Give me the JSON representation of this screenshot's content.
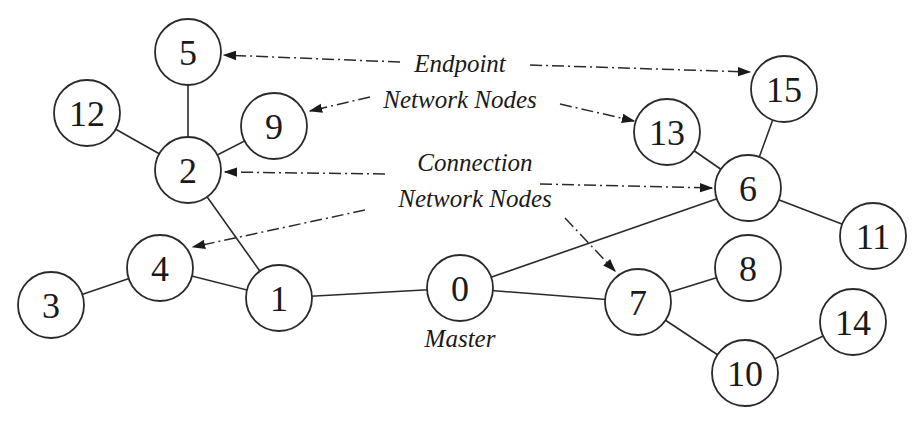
{
  "diagram": {
    "title": "",
    "nodes": [
      {
        "id": "0",
        "label": "0",
        "x": 460,
        "y": 288,
        "caption": "Master"
      },
      {
        "id": "1",
        "label": "1",
        "x": 279,
        "y": 298
      },
      {
        "id": "2",
        "label": "2",
        "x": 188,
        "y": 170
      },
      {
        "id": "3",
        "label": "3",
        "x": 51,
        "y": 305
      },
      {
        "id": "4",
        "label": "4",
        "x": 160,
        "y": 268
      },
      {
        "id": "5",
        "label": "5",
        "x": 188,
        "y": 52
      },
      {
        "id": "6",
        "label": "6",
        "x": 748,
        "y": 188
      },
      {
        "id": "7",
        "label": "7",
        "x": 638,
        "y": 302
      },
      {
        "id": "8",
        "label": "8",
        "x": 748,
        "y": 268
      },
      {
        "id": "9",
        "label": "9",
        "x": 274,
        "y": 126
      },
      {
        "id": "10",
        "label": "10",
        "x": 745,
        "y": 373
      },
      {
        "id": "11",
        "label": "11",
        "x": 873,
        "y": 236
      },
      {
        "id": "12",
        "label": "12",
        "x": 87,
        "y": 113
      },
      {
        "id": "13",
        "label": "13",
        "x": 667,
        "y": 132
      },
      {
        "id": "14",
        "label": "14",
        "x": 853,
        "y": 322
      },
      {
        "id": "15",
        "label": "15",
        "x": 784,
        "y": 89
      }
    ],
    "edges": [
      [
        "0",
        "1"
      ],
      [
        "0",
        "6"
      ],
      [
        "0",
        "7"
      ],
      [
        "1",
        "2"
      ],
      [
        "1",
        "4"
      ],
      [
        "4",
        "3"
      ],
      [
        "2",
        "5"
      ],
      [
        "2",
        "12"
      ],
      [
        "2",
        "9"
      ],
      [
        "6",
        "13"
      ],
      [
        "6",
        "15"
      ],
      [
        "6",
        "11"
      ],
      [
        "7",
        "8"
      ],
      [
        "7",
        "10"
      ],
      [
        "10",
        "14"
      ]
    ],
    "annotations": [
      {
        "line1": "Endpoint",
        "line2": "Network Nodes",
        "x": 460,
        "y1": 64,
        "y2": 101,
        "targets": [
          "5",
          "9",
          "15",
          "13"
        ]
      },
      {
        "line1": "Connection",
        "line2": "Network Nodes",
        "x": 475,
        "y1": 170,
        "y2": 207,
        "targets": [
          "2",
          "6",
          "4",
          "7"
        ]
      }
    ],
    "master_caption": "Master"
  }
}
